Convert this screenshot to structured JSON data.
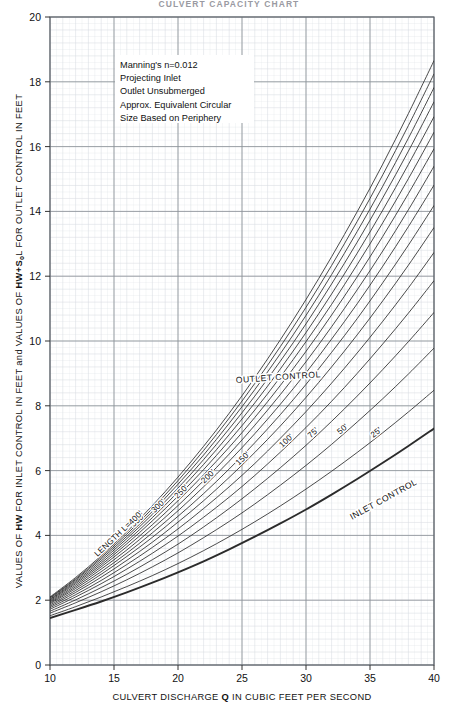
{
  "figure": {
    "top_title": "CULVERT CAPACITY CHART",
    "background": "#ffffff",
    "grid_minor_color": "#d9dde2",
    "grid_major_color": "#8d9298",
    "frame_color": "#5a5f66",
    "curve_color": "#2b2b2b"
  },
  "axes": {
    "x_label_pre": "CULVERT DISCHARGE ",
    "x_label_bold": "Q",
    "x_label_post": " IN CUBIC FEET PER SECOND",
    "x_ticks": [
      "10",
      "15",
      "20",
      "25",
      "30",
      "35",
      "40"
    ],
    "x_min": 10,
    "x_max": 40,
    "x_major_step": 5,
    "x_minor_step": 1,
    "y_label_part1_pre": "VALUES OF ",
    "y_label_part1_bold": "HW",
    "y_label_part1_post": " FOR INLET CONTROL IN FEET and VALUES OF ",
    "y_label_part2_bold": "HW",
    "y_label_part2_post": "+S",
    "y_label_sub": "o",
    "y_label_part3": "L FOR OUTLET CONTROL IN FEET",
    "y_ticks": [
      "0",
      "2",
      "4",
      "6",
      "8",
      "10",
      "12",
      "14",
      "16",
      "18",
      "20"
    ],
    "y_min": 0,
    "y_max": 20,
    "y_major_step": 2,
    "y_minor_step": 0.4
  },
  "notes": {
    "lines": [
      "Manning's n=0.012",
      "Projecting Inlet",
      "Outlet Unsubmerged",
      "Approx. Equivalent Circular",
      "Size Based on Periphery"
    ]
  },
  "region_labels": {
    "outlet": "OUTLET CONTROL",
    "inlet": "INLET CONTROL"
  },
  "chart_data": {
    "type": "line",
    "title": "CULVERT CAPACITY CHART",
    "xlabel": "CULVERT DISCHARGE Q IN CUBIC FEET PER SECOND",
    "ylabel": "VALUES OF HW FOR INLET CONTROL IN FEET and VALUES OF HW+SoL FOR OUTLET CONTROL IN FEET",
    "xlim": [
      10,
      40
    ],
    "ylim": [
      0,
      20
    ],
    "grid": true,
    "legend": "inline-curve-labels",
    "x": [
      10,
      12,
      14,
      16,
      18,
      20,
      22,
      24,
      26,
      28,
      30,
      32,
      34,
      36,
      38,
      40
    ],
    "series": [
      {
        "name": "INLET CONTROL",
        "label": "",
        "emphasis": "bold",
        "values": [
          1.45,
          1.7,
          1.96,
          2.24,
          2.54,
          2.86,
          3.2,
          3.57,
          3.96,
          4.37,
          4.8,
          5.26,
          5.74,
          6.24,
          6.76,
          7.3
        ]
      },
      {
        "name": "L=25'",
        "label": "25'",
        "values": [
          1.52,
          1.8,
          2.1,
          2.42,
          2.76,
          3.13,
          3.53,
          3.96,
          4.42,
          4.91,
          5.43,
          5.98,
          6.56,
          7.17,
          7.81,
          8.48
        ]
      },
      {
        "name": "L=50'",
        "label": "50'",
        "values": [
          1.6,
          1.92,
          2.26,
          2.63,
          3.03,
          3.46,
          3.93,
          4.43,
          4.97,
          5.55,
          6.16,
          6.81,
          7.5,
          8.22,
          8.98,
          9.78
        ]
      },
      {
        "name": "L=75'",
        "label": "75'",
        "values": [
          1.66,
          2.01,
          2.39,
          2.8,
          3.25,
          3.73,
          4.26,
          4.83,
          5.44,
          6.09,
          6.78,
          7.52,
          8.3,
          9.12,
          9.98,
          10.88
        ]
      },
      {
        "name": "L=100'",
        "label": "100'",
        "values": [
          1.72,
          2.1,
          2.51,
          2.96,
          3.45,
          3.98,
          4.56,
          5.18,
          5.85,
          6.57,
          7.33,
          8.14,
          9.0,
          9.91,
          10.86,
          11.86
        ]
      },
      {
        "name": "L=125'",
        "label": "",
        "values": [
          1.77,
          2.17,
          2.61,
          3.1,
          3.63,
          4.2,
          4.83,
          5.5,
          6.22,
          7.0,
          7.82,
          8.7,
          9.63,
          10.61,
          11.64,
          12.73
        ]
      },
      {
        "name": "L=150'",
        "label": "150'",
        "values": [
          1.81,
          2.24,
          2.71,
          3.23,
          3.79,
          4.41,
          5.07,
          5.79,
          6.56,
          7.38,
          8.26,
          9.2,
          10.19,
          11.24,
          12.34,
          13.5
        ]
      },
      {
        "name": "L=175'",
        "label": "",
        "values": [
          1.85,
          2.3,
          2.8,
          3.35,
          3.94,
          4.59,
          5.29,
          6.05,
          6.86,
          7.73,
          8.66,
          9.65,
          10.69,
          11.8,
          12.96,
          14.18
        ]
      },
      {
        "name": "L=200'",
        "label": "200'",
        "values": [
          1.89,
          2.36,
          2.88,
          3.45,
          4.08,
          4.76,
          5.5,
          6.29,
          7.14,
          8.05,
          9.02,
          10.06,
          11.15,
          12.31,
          13.53,
          14.81
        ]
      },
      {
        "name": "L=225'",
        "label": "",
        "values": [
          1.92,
          2.41,
          2.96,
          3.55,
          4.21,
          4.92,
          5.69,
          6.51,
          7.4,
          8.35,
          9.36,
          10.44,
          11.58,
          12.78,
          14.05,
          15.39
        ]
      },
      {
        "name": "L=250'",
        "label": "250'",
        "values": [
          1.95,
          2.46,
          3.03,
          3.65,
          4.33,
          5.07,
          5.87,
          6.72,
          7.64,
          8.63,
          9.68,
          10.8,
          11.98,
          13.23,
          14.55,
          15.93
        ]
      },
      {
        "name": "L=275'",
        "label": "",
        "values": [
          1.98,
          2.51,
          3.09,
          3.74,
          4.45,
          5.21,
          6.03,
          6.92,
          7.87,
          8.89,
          9.98,
          11.13,
          12.36,
          13.65,
          15.01,
          16.44
        ]
      },
      {
        "name": "L=300'",
        "label": "300'",
        "values": [
          2.01,
          2.55,
          3.15,
          3.82,
          4.55,
          5.34,
          6.19,
          7.11,
          8.09,
          9.14,
          10.26,
          11.45,
          12.71,
          14.04,
          15.45,
          16.92
        ]
      },
      {
        "name": "L=325'",
        "label": "",
        "values": [
          2.03,
          2.59,
          3.21,
          3.9,
          4.65,
          5.46,
          6.34,
          7.29,
          8.3,
          9.38,
          10.53,
          11.76,
          13.05,
          14.42,
          15.86,
          17.38
        ]
      },
      {
        "name": "L=350'",
        "label": "350'",
        "values": [
          2.06,
          2.63,
          3.27,
          3.97,
          4.74,
          5.58,
          6.48,
          7.46,
          8.5,
          9.61,
          10.79,
          12.05,
          13.38,
          14.78,
          16.26,
          17.82
        ]
      },
      {
        "name": "L=375'",
        "label": "",
        "values": [
          2.08,
          2.66,
          3.32,
          4.04,
          4.83,
          5.69,
          6.62,
          7.62,
          8.69,
          9.83,
          11.04,
          12.33,
          13.69,
          15.13,
          16.65,
          18.24
        ]
      },
      {
        "name": "LENGTH L=400'",
        "label": "LENGTH L=400'",
        "values": [
          2.1,
          2.7,
          3.37,
          4.11,
          4.92,
          5.8,
          6.75,
          7.77,
          8.87,
          10.04,
          11.28,
          12.6,
          13.99,
          15.46,
          17.02,
          18.65
        ]
      }
    ],
    "curve_labels": [
      "LENGTH L=400'",
      "350'",
      "300'",
      "250'",
      "200'",
      "150'",
      "100'",
      "75'",
      "50'",
      "25'"
    ],
    "annotations": [
      "OUTLET CONTROL",
      "INLET CONTROL"
    ]
  }
}
